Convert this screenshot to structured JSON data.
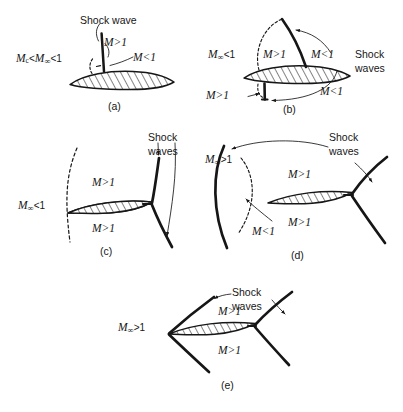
{
  "figure": {
    "background_color": "#ffffff",
    "ink_color": "#161616",
    "panel_count": 5
  },
  "panels": [
    {
      "id": "a",
      "label": "(a)",
      "regime": "subcritical-to-critical subsonic",
      "freestream_label": "Mc<M∞<1",
      "freestream_parts": {
        "m": "M",
        "sub": "c",
        "rel1": "<",
        "m2": "M",
        "inf": "∞",
        "rel2": "<1"
      },
      "shock_label": "Shock wave",
      "region_labels": [
        {
          "name": "supersonic-pocket",
          "text": "M>1"
        },
        {
          "name": "subsonic-aft",
          "text": "M<1"
        }
      ]
    },
    {
      "id": "b",
      "label": "(b)",
      "regime": "supercritical transonic, shocks on both surfaces",
      "freestream_label": "M∞<1",
      "shock_label_line1": "Shock",
      "shock_label_line2": "waves",
      "region_labels": [
        {
          "name": "upper-supersonic-pocket",
          "text": "M>1"
        },
        {
          "name": "upper-subsonic-aft",
          "text": "M<1"
        },
        {
          "name": "lower-supersonic-pocket",
          "text": "M>1"
        },
        {
          "name": "lower-subsonic-aft",
          "text": "M<1"
        }
      ]
    },
    {
      "id": "c",
      "label": "(c)",
      "regime": "high transonic, shocks moved to trailing edge",
      "freestream_label": "M∞<1",
      "shock_label_line1": "Shock",
      "shock_label_line2": "waves",
      "region_labels": [
        {
          "name": "upper-supersonic",
          "text": "M>1"
        },
        {
          "name": "lower-supersonic",
          "text": "M>1"
        }
      ]
    },
    {
      "id": "d",
      "label": "(d)",
      "regime": "low supersonic with detached bow shock",
      "freestream_label": "M∞>1",
      "shock_label_line1": "Shock",
      "shock_label_line2": "waves",
      "region_labels": [
        {
          "name": "upper-supersonic",
          "text": "M>1"
        },
        {
          "name": "lower-supersonic",
          "text": "M>1"
        },
        {
          "name": "subsonic-bubble",
          "text": "M<1"
        }
      ]
    },
    {
      "id": "e",
      "label": "(e)",
      "regime": "supersonic with attached oblique shocks",
      "freestream_label": "M∞>1",
      "shock_label_line1": "Shock",
      "shock_label_line2": "waves",
      "region_labels": [
        {
          "name": "upper-supersonic",
          "text": "M>1"
        },
        {
          "name": "lower-supersonic",
          "text": "M>1"
        }
      ]
    }
  ],
  "icons": [
    {
      "name": "shock-wave-stroke",
      "desc": "thick black curve denoting shock"
    },
    {
      "name": "sonic-line-dashed",
      "desc": "dashed curve bounding M=1 region"
    },
    {
      "name": "leader-arrow",
      "desc": "thin line with arrowhead to callout"
    },
    {
      "name": "airfoil-hatched",
      "desc": "lens profile with diagonal hatching"
    }
  ]
}
